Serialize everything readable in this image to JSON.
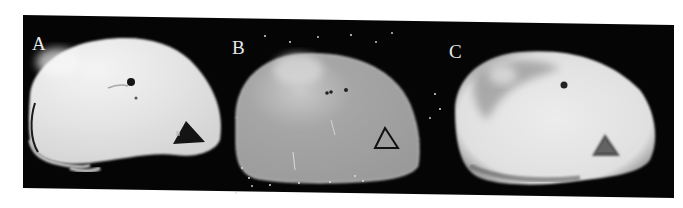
{
  "figure": {
    "panels": [
      {
        "label": "A",
        "description": "axial MR slice, bright homogeneous tissue with dark triangular marker"
      },
      {
        "label": "B",
        "description": "axial parametric map, grey with bright region and outlined triangular marker, speckle noise in background"
      },
      {
        "label": "C",
        "description": "axial MR slice, bright tissue with heterogeneous darker region and grey triangular marker"
      }
    ],
    "colors": {
      "background": "#ffffff",
      "frame": "#050505",
      "label": "#e8e8e8",
      "tissue_bright": "#e6e6e6",
      "tissue_grey": "#9a9a9a"
    }
  }
}
